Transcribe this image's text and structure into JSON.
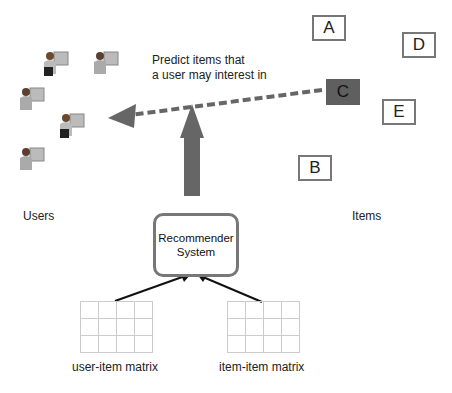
{
  "diagram": {
    "annotation": [
      "Predict items that",
      "a user may interest in"
    ],
    "users_label": "Users",
    "items_label": "Items",
    "recommender": [
      "Recommender",
      "System"
    ],
    "items": [
      {
        "id": "A",
        "selected": false
      },
      {
        "id": "B",
        "selected": false
      },
      {
        "id": "C",
        "selected": true
      },
      {
        "id": "D",
        "selected": false
      },
      {
        "id": "E",
        "selected": false
      }
    ],
    "matrices": {
      "left_label": "user-item matrix",
      "right_label": "item-item matrix",
      "rows": 3,
      "cols": 4
    },
    "users_count": 5,
    "colors": {
      "arrow": "#666666",
      "box_border": "#777777",
      "selected_fill": "#5f5f5f",
      "grid": "#cccccc"
    }
  }
}
